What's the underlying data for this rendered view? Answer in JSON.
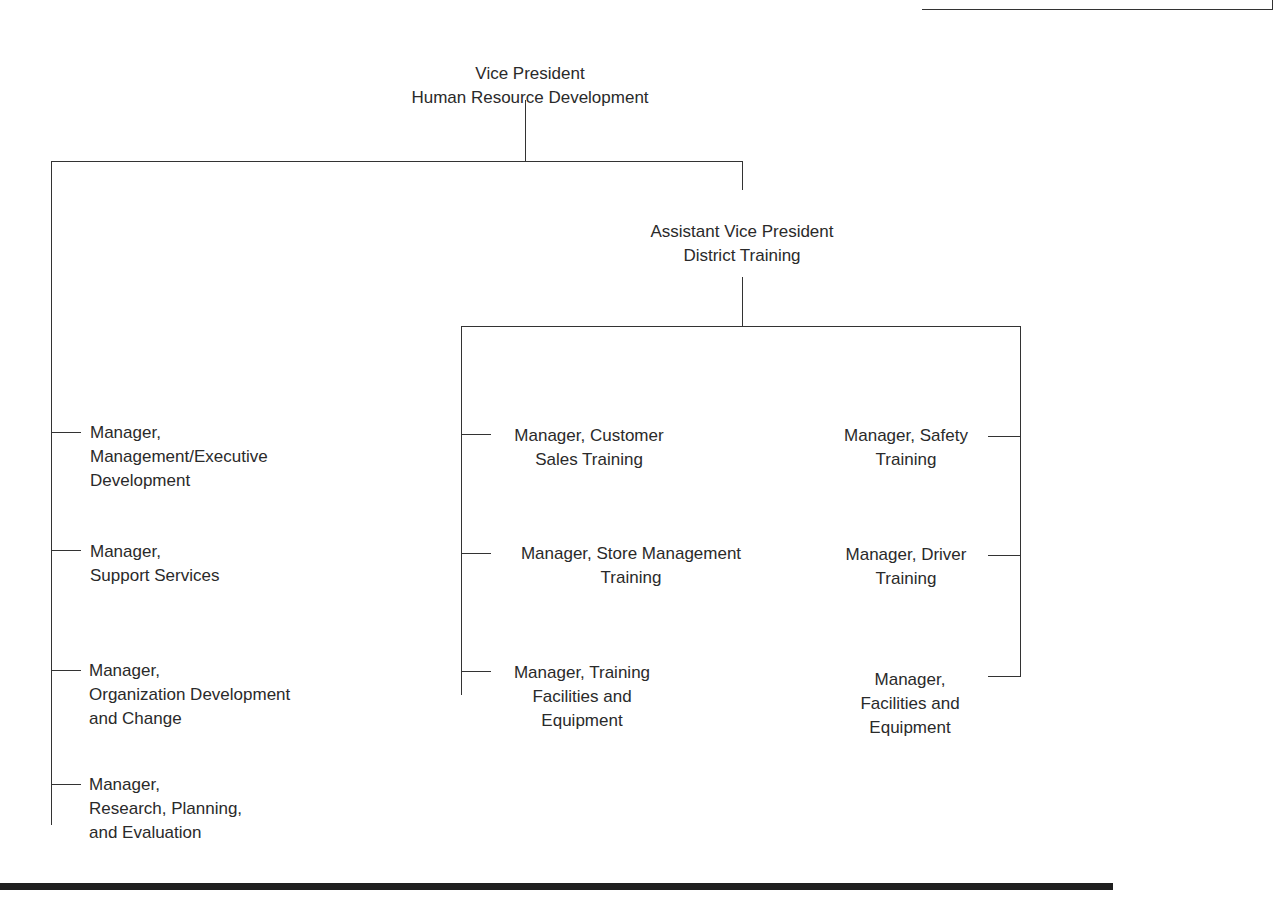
{
  "diagram": {
    "type": "organization-chart",
    "root": {
      "line1": "Vice President",
      "line2": "Human Resource Development"
    },
    "left_branch": [
      {
        "line1": "Manager,",
        "line2": "Management/Executive",
        "line3": "Development"
      },
      {
        "line1": "Manager,",
        "line2": "Support Services"
      },
      {
        "line1": "Manager,",
        "line2": "Organization Development",
        "line3": "and Change"
      },
      {
        "line1": "Manager,",
        "line2": "Research, Planning,",
        "line3": "and Evaluation"
      }
    ],
    "avp": {
      "line1": "Assistant Vice President",
      "line2": "District Training"
    },
    "avp_left": [
      {
        "line1": "Manager, Customer",
        "line2": "Sales Training"
      },
      {
        "line1": "Manager, Store Management",
        "line2": "Training"
      },
      {
        "line1": "Manager, Training",
        "line2": "Facilities and",
        "line3": "Equipment"
      }
    ],
    "avp_right": [
      {
        "line1": "Manager, Safety",
        "line2": "Training"
      },
      {
        "line1": "Manager, Driver",
        "line2": "Training"
      },
      {
        "line1": "Manager,",
        "line2": "Facilities and",
        "line3": "Equipment"
      }
    ]
  }
}
